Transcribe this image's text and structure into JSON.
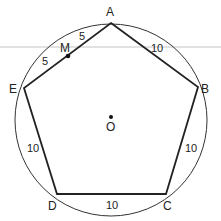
{
  "figure": {
    "type": "regular pentagon inscribed in circle",
    "rule_line": {
      "y": 47,
      "color": "#bbbbbb"
    },
    "circle": {
      "center": "O",
      "cx": 111,
      "cy": 120,
      "r": 96,
      "color": "#333333"
    },
    "stroke_color": "#222222",
    "vertices": {
      "A": {
        "label": "A",
        "x": 111,
        "y": 23
      },
      "B": {
        "label": "B",
        "x": 198,
        "y": 87
      },
      "C": {
        "label": "C",
        "x": 166,
        "y": 194
      },
      "D": {
        "label": "D",
        "x": 57,
        "y": 194
      },
      "E": {
        "label": "E",
        "x": 24,
        "y": 88
      }
    },
    "points": {
      "O": {
        "label": "O",
        "x": 111,
        "y": 119
      },
      "M": {
        "label": "M",
        "x": 68,
        "y": 56
      }
    },
    "segment_labels": {
      "AM": "5",
      "ME": "5",
      "AB": "10",
      "BC": "10",
      "CD": "10",
      "DE": "10"
    }
  }
}
